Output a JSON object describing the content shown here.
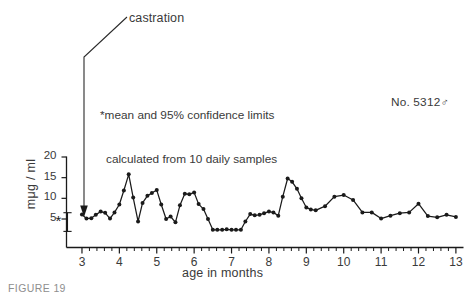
{
  "figure": {
    "caption": "FIGURE 19",
    "specimen_id": "No. 5312",
    "male_symbol": "♂",
    "annotations": {
      "castration_label": "castration",
      "footnote_line1": "*mean and 95% confidence limits",
      "footnote_line2": "calculated from 10 daily samples"
    }
  },
  "chart_data": {
    "type": "line",
    "title": "",
    "xlabel": "age in months",
    "ylabel": "mμg / ml",
    "xlim": [
      2.72,
      13.15
    ],
    "ylim": [
      0,
      21.2
    ],
    "grid": false,
    "legend": "none",
    "xticks": [
      3,
      4,
      5,
      6,
      7,
      8,
      9,
      10,
      11,
      12,
      13
    ],
    "xtick_labels": [
      "3",
      "4",
      "5",
      "6",
      "7",
      "8",
      "9",
      "10",
      "11",
      "12",
      "13"
    ],
    "minor_ticks_per_interval": 4,
    "yticks": [
      5,
      10,
      15,
      20
    ],
    "ytick_labels": [
      "5",
      "10",
      "15",
      "20"
    ],
    "marker": "filled-circle",
    "line_color": "#1a1a1a",
    "series": [
      {
        "name": "plasma androgen",
        "x": [
          3.0,
          3.12,
          3.25,
          3.37,
          3.5,
          3.62,
          3.75,
          3.87,
          4.0,
          4.12,
          4.25,
          4.37,
          4.5,
          4.62,
          4.75,
          4.87,
          5.0,
          5.12,
          5.25,
          5.37,
          5.5,
          5.62,
          5.75,
          5.87,
          6.0,
          6.12,
          6.25,
          6.37,
          6.5,
          6.62,
          6.75,
          6.87,
          7.0,
          7.12,
          7.25,
          7.37,
          7.5,
          7.62,
          7.75,
          7.87,
          8.0,
          8.12,
          8.25,
          8.37,
          8.5,
          8.62,
          8.75,
          8.87,
          9.0,
          9.12,
          9.25,
          9.5,
          9.75,
          10.0,
          10.25,
          10.5,
          10.75,
          11.0,
          11.25,
          11.5,
          11.75,
          12.0,
          12.25,
          12.5,
          12.75,
          13.0
        ],
        "y": [
          6.1,
          5.1,
          5.2,
          6.0,
          6.8,
          6.5,
          5.1,
          6.6,
          8.5,
          11.9,
          15.8,
          10.2,
          4.4,
          8.9,
          10.6,
          11.3,
          12.0,
          8.5,
          5.0,
          5.6,
          4.2,
          8.3,
          11.1,
          11.0,
          11.4,
          8.6,
          7.4,
          5.0,
          2.4,
          2.4,
          2.4,
          2.5,
          2.4,
          2.4,
          2.4,
          4.4,
          6.2,
          5.9,
          6.0,
          6.4,
          6.8,
          6.6,
          5.8,
          10.4,
          14.8,
          14.0,
          12.3,
          10.0,
          7.8,
          7.3,
          7.1,
          8.1,
          10.4,
          10.8,
          9.6,
          6.6,
          6.6,
          5.1,
          5.8,
          6.4,
          6.6,
          8.7,
          5.7,
          5.4,
          6.0,
          5.5
        ]
      }
    ],
    "error_bar": {
      "label": "*",
      "x": 2.88,
      "mean": 6.2,
      "lower": 4.0,
      "upper": 8.5,
      "description": "mean and 95% confidence limits calculated from 10 daily samples"
    },
    "event_marker": {
      "label": "castration",
      "x": 3.32,
      "arrow": "down"
    }
  }
}
